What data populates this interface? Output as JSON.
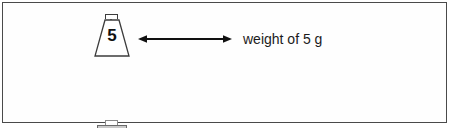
{
  "figure": {
    "background_color": "#ffffff",
    "frame_color": "#4a4a4a",
    "rows": [
      {
        "id": "row-known-weight",
        "weight_shape": "trapezoid",
        "weight_label": "5",
        "weight_fill": "#ffffff",
        "arrow": "double-headed-arrow",
        "caption_prefix": "weight of ",
        "caption_value": "5",
        "caption_suffix": " g",
        "caption_full": "weight of 5 g"
      },
      {
        "id": "row-unknown-weight",
        "weight_shape": "rectangle",
        "weight_label": "?",
        "weight_fill": "#c9c9c9",
        "arrow": "double-headed-arrow",
        "caption_prefix": "weight of ",
        "caption_value": "?",
        "caption_suffix": " g",
        "caption_full": "weight of ? g"
      }
    ]
  }
}
